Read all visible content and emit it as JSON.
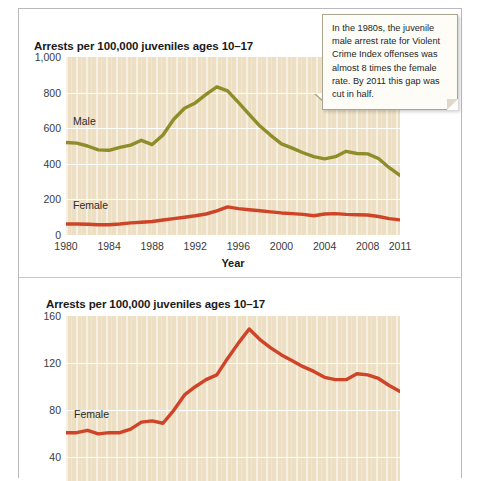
{
  "callout": {
    "text": "In the 1980s, the juvenile male arrest rate for Violent Crime Index offenses was almost 8 times the female rate. By 2011 this gap was cut in half."
  },
  "colors": {
    "male_line": "#8f8c2a",
    "female_line": "#cf4428",
    "plot_background": "#ecdfc4",
    "gridline": "#ffffff",
    "text": "#1a1a1a",
    "card_border": "#b9b9b9"
  },
  "chart_data": [
    {
      "id": "top-chart",
      "type": "line",
      "title": "Arrests per 100,000 juveniles ages 10–17",
      "xlabel": "Year",
      "ylabel": "",
      "xlim": [
        1980,
        2011
      ],
      "ylim": [
        0,
        1000
      ],
      "grid": true,
      "legend": "inline-labels",
      "yticks": [
        "0",
        "200",
        "400",
        "600",
        "800",
        "1,000"
      ],
      "ytick_values": [
        0,
        200,
        400,
        600,
        800,
        1000
      ],
      "xticks": [
        "1980",
        "1984",
        "1988",
        "1992",
        "1996",
        "2000",
        "2004",
        "2008",
        "2011"
      ],
      "xtick_values": [
        1980,
        1984,
        1988,
        1992,
        1996,
        2000,
        2004,
        2008,
        2011
      ],
      "x": [
        1980,
        1981,
        1982,
        1983,
        1984,
        1985,
        1986,
        1987,
        1988,
        1989,
        1990,
        1991,
        1992,
        1993,
        1994,
        1995,
        1996,
        1997,
        1998,
        1999,
        2000,
        2001,
        2002,
        2003,
        2004,
        2005,
        2006,
        2007,
        2008,
        2009,
        2010,
        2011
      ],
      "series": [
        {
          "name": "Male",
          "color": "#8f8c2a",
          "values": [
            520,
            516,
            500,
            478,
            476,
            492,
            505,
            532,
            508,
            562,
            650,
            712,
            742,
            790,
            832,
            810,
            745,
            678,
            612,
            560,
            512,
            488,
            462,
            440,
            428,
            440,
            470,
            458,
            456,
            430,
            378,
            335
          ]
        },
        {
          "name": "Female",
          "color": "#cf4428",
          "values": [
            62,
            62,
            60,
            58,
            58,
            62,
            68,
            72,
            76,
            84,
            92,
            100,
            108,
            118,
            136,
            158,
            148,
            142,
            136,
            130,
            124,
            120,
            116,
            108,
            118,
            120,
            116,
            114,
            112,
            104,
            92,
            85
          ]
        }
      ]
    },
    {
      "id": "bottom-chart",
      "type": "line",
      "title": "Arrests per 100,000 juveniles ages 10–17",
      "xlabel": "",
      "ylabel": "",
      "xlim": [
        1980,
        2011
      ],
      "ylim": [
        20,
        160
      ],
      "grid": true,
      "legend": "inline-labels",
      "yticks": [
        "40",
        "80",
        "120",
        "160"
      ],
      "ytick_values": [
        40,
        80,
        120,
        160
      ],
      "xticks": [],
      "xtick_values": [],
      "x": [
        1980,
        1981,
        1982,
        1983,
        1984,
        1985,
        1986,
        1987,
        1988,
        1989,
        1990,
        1991,
        1992,
        1993,
        1994,
        1995,
        1996,
        1997,
        1998,
        1999,
        2000,
        2001,
        2002,
        2003,
        2004,
        2005,
        2006,
        2007,
        2008,
        2009,
        2010,
        2011
      ],
      "series": [
        {
          "name": "Female",
          "color": "#cf4428",
          "values": [
            61,
            61,
            63,
            60,
            61,
            61,
            64,
            70,
            71,
            69,
            80,
            93,
            100,
            106,
            110,
            124,
            137,
            149,
            140,
            133,
            127,
            122,
            117,
            113,
            108,
            106,
            106,
            111,
            110,
            107,
            101,
            96
          ]
        }
      ]
    }
  ]
}
